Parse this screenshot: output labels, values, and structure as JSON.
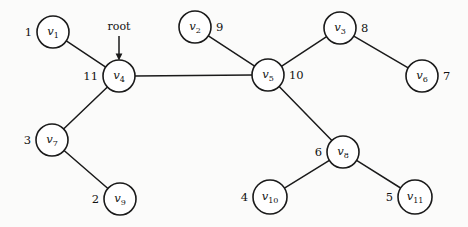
{
  "figure": {
    "root_label": "root",
    "nodes": [
      {
        "id": "v1",
        "base": "v",
        "sub": "1",
        "weight": "1",
        "cx": 53,
        "cy": 32,
        "r": 16,
        "weight_side": "left"
      },
      {
        "id": "v2",
        "base": "v",
        "sub": "2",
        "weight": "9",
        "cx": 195,
        "cy": 27,
        "r": 16,
        "weight_side": "right"
      },
      {
        "id": "v3",
        "base": "v",
        "sub": "3",
        "weight": "8",
        "cx": 340,
        "cy": 28,
        "r": 16,
        "weight_side": "right"
      },
      {
        "id": "v4",
        "base": "v",
        "sub": "4",
        "weight": "11",
        "cx": 119,
        "cy": 76,
        "r": 16,
        "weight_side": "left"
      },
      {
        "id": "v5",
        "base": "v",
        "sub": "5",
        "weight": "10",
        "cx": 268,
        "cy": 75,
        "r": 16,
        "weight_side": "right"
      },
      {
        "id": "v6",
        "base": "v",
        "sub": "6",
        "weight": "7",
        "cx": 422,
        "cy": 76,
        "r": 16,
        "weight_side": "right"
      },
      {
        "id": "v7",
        "base": "v",
        "sub": "7",
        "weight": "3",
        "cx": 52,
        "cy": 140,
        "r": 16,
        "weight_side": "left"
      },
      {
        "id": "v8",
        "base": "v",
        "sub": "8",
        "weight": "6",
        "cx": 343,
        "cy": 152,
        "r": 16,
        "weight_side": "left"
      },
      {
        "id": "v9",
        "base": "v",
        "sub": "9",
        "weight": "2",
        "cx": 120,
        "cy": 199,
        "r": 16,
        "weight_side": "left"
      },
      {
        "id": "v10",
        "base": "v",
        "sub": "10",
        "weight": "4",
        "cx": 270,
        "cy": 197,
        "r": 17,
        "weight_side": "left"
      },
      {
        "id": "v11",
        "base": "v",
        "sub": "11",
        "weight": "5",
        "cx": 415,
        "cy": 197,
        "r": 17,
        "weight_side": "left"
      }
    ],
    "edges": [
      {
        "from": "v1",
        "to": "v4"
      },
      {
        "from": "v4",
        "to": "v5"
      },
      {
        "from": "v4",
        "to": "v7"
      },
      {
        "from": "v7",
        "to": "v9"
      },
      {
        "from": "v2",
        "to": "v5"
      },
      {
        "from": "v5",
        "to": "v3"
      },
      {
        "from": "v3",
        "to": "v6"
      },
      {
        "from": "v5",
        "to": "v8"
      },
      {
        "from": "v8",
        "to": "v10"
      },
      {
        "from": "v8",
        "to": "v11"
      }
    ],
    "root_pointer": {
      "target": "v4",
      "label_x": 119,
      "label_y": 30,
      "line_top_y": 36
    }
  }
}
